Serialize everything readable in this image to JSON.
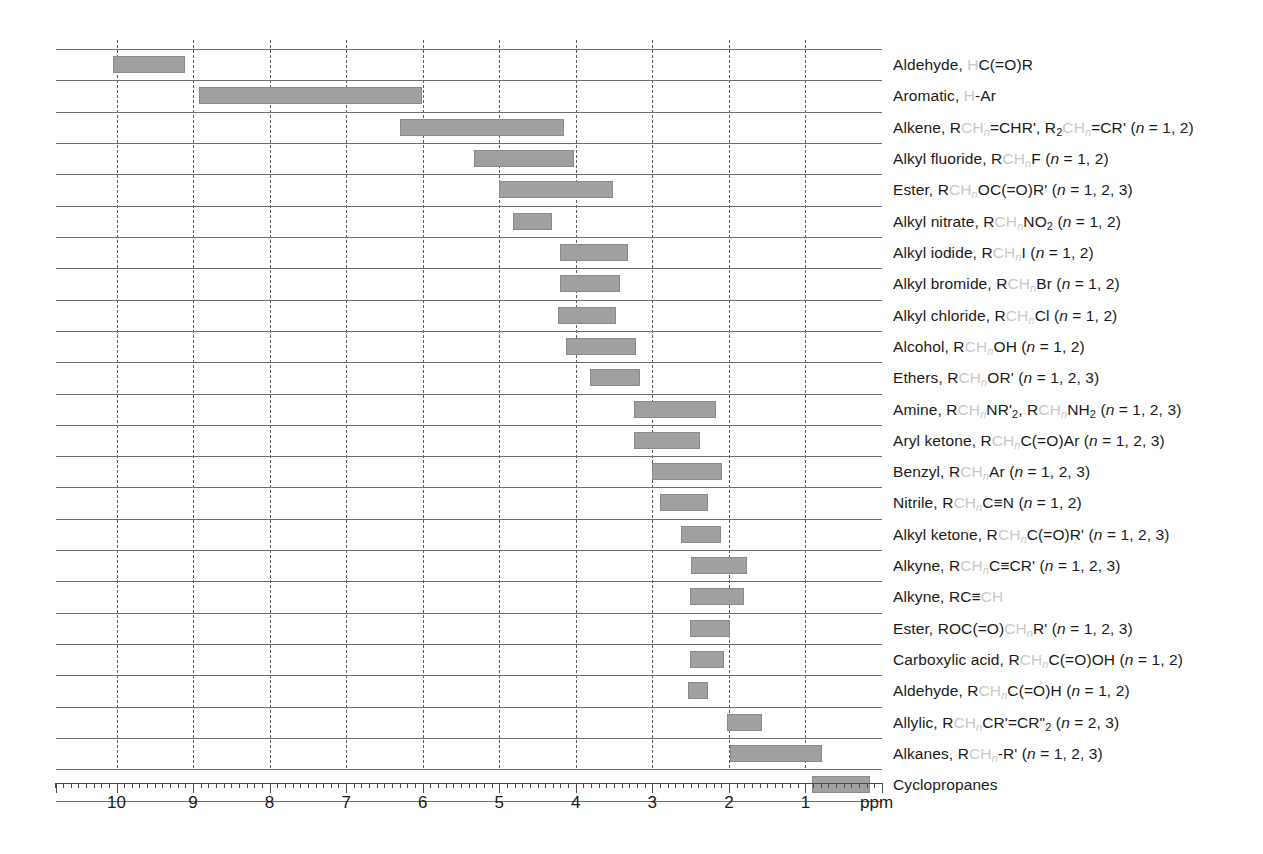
{
  "chart_data": {
    "type": "bar",
    "orientation": "horizontal-range",
    "title": "",
    "xlabel": "ppm",
    "ylabel": "",
    "xlim": [
      10.78,
      0
    ],
    "x_axis_reversed": true,
    "grid": true,
    "legend": null,
    "axis": {
      "unit_label": "ppm",
      "tick_labels": [
        "10",
        "9",
        "8",
        "7",
        "6",
        "5",
        "4",
        "3",
        "2",
        "1"
      ],
      "tick_values": [
        10,
        9,
        8,
        7,
        6,
        5,
        4,
        3,
        2,
        1
      ],
      "minor_tick_step": 0.1,
      "major_tick_step": 1
    },
    "gridline_values": [
      10,
      9,
      8,
      7,
      6,
      5,
      4,
      3,
      2,
      1
    ],
    "bar_color": "#a0a0a0",
    "highlight_color": "#c9c9c9",
    "categories": [
      "Aldehyde, HC(=O)R",
      "Aromatic, H-Ar",
      "Alkene, RCHn=CHR', RCHn=CR'2 (n = 1, 2)",
      "Alkyl fluoride, RCHnF (n = 1, 2)",
      "Ester, RCHnOC(=O)R' (n = 1, 2, 3)",
      "Alkyl nitrate, RCHnNO2 (n = 1, 2)",
      "Alkyl iodide, RCHnI (n = 1, 2)",
      "Alkyl bromide, RCHnBr (n = 1, 2)",
      "Alkyl chloride, RCHnCl (n = 1, 2)",
      "Alcohol, RCHnOH (n = 1, 2)",
      "Ethers, RCHnOR' (n = 1, 2, 3)",
      "Amine, RCHnNR'2, RCHnNH2 (n = 1, 2, 3)",
      "Aryl ketone, RCHnC(=O)Ar (n = 1, 2, 3)",
      "Benzyl, RCHnAr (n = 1, 2, 3)",
      "Nitrile, RCHnC≡N (n = 1, 2)",
      "Alkyl ketone, RCHnC(=O)R' (n = 1, 2, 3)",
      "Alkyne, RCHnC≡CR' (n = 1, 2, 3)",
      "Alkyne, RC≡CH",
      "Ester, ROC(=O)CHnR' (n = 1, 2, 3)",
      "Carboxylic acid, RCHnC(=O)OH (n = 1, 2)",
      "Aldehyde, RCHnC(=O)H (n = 1, 2)",
      "Allylic, RCHnCR'=CR\"2 (n = 2, 3)",
      "Alkanes, RCHn-R' (n = 1, 2, 3)",
      "Cyclopropanes"
    ],
    "ranges": [
      {
        "label": "Aldehyde",
        "from_ppm": 10.05,
        "to_ppm": 9.1
      },
      {
        "label": "Aromatic",
        "from_ppm": 8.92,
        "to_ppm": 6.01
      },
      {
        "label": "Alkene",
        "from_ppm": 6.3,
        "to_ppm": 4.16
      },
      {
        "label": "Alkyl fluoride",
        "from_ppm": 5.33,
        "to_ppm": 4.02
      },
      {
        "label": "Ester",
        "from_ppm": 5.0,
        "to_ppm": 3.51
      },
      {
        "label": "Alkyl nitrate",
        "from_ppm": 4.82,
        "to_ppm": 4.31
      },
      {
        "label": "Alkyl iodide",
        "from_ppm": 4.2,
        "to_ppm": 3.32
      },
      {
        "label": "Alkyl bromide",
        "from_ppm": 4.2,
        "to_ppm": 3.42
      },
      {
        "label": "Alkyl chloride",
        "from_ppm": 4.23,
        "to_ppm": 3.47
      },
      {
        "label": "Alcohol",
        "from_ppm": 4.13,
        "to_ppm": 3.21
      },
      {
        "label": "Ethers",
        "from_ppm": 3.81,
        "to_ppm": 3.16
      },
      {
        "label": "Amine",
        "from_ppm": 3.24,
        "to_ppm": 2.17
      },
      {
        "label": "Aryl ketone",
        "from_ppm": 3.24,
        "to_ppm": 2.38
      },
      {
        "label": "Benzyl",
        "from_ppm": 3.01,
        "to_ppm": 2.09
      },
      {
        "label": "Nitrile",
        "from_ppm": 2.9,
        "to_ppm": 2.27
      },
      {
        "label": "Alkyl ketone",
        "from_ppm": 2.62,
        "to_ppm": 2.1
      },
      {
        "label": "Alkyne",
        "from_ppm": 2.49,
        "to_ppm": 1.76
      },
      {
        "label": "Alkyne terminal",
        "from_ppm": 2.51,
        "to_ppm": 1.8
      },
      {
        "label": "Ester alpha",
        "from_ppm": 2.51,
        "to_ppm": 1.98
      },
      {
        "label": "Carboxylic acid",
        "from_ppm": 2.51,
        "to_ppm": 2.06
      },
      {
        "label": "Aldehyde alpha",
        "from_ppm": 2.53,
        "to_ppm": 2.27
      },
      {
        "label": "Allylic",
        "from_ppm": 2.02,
        "to_ppm": 1.57
      },
      {
        "label": "Alkanes",
        "from_ppm": 1.98,
        "to_ppm": 0.78
      },
      {
        "label": "Cyclopropanes",
        "from_ppm": 0.91,
        "to_ppm": 0.16
      }
    ]
  },
  "rows": [
    {
      "prefix": "Aldehyde, ",
      "hl1": "H",
      "mid": "C(=O)R",
      "hl2": "",
      "suffix": "",
      "nrange": ""
    },
    {
      "prefix": "Aromatic, ",
      "hl1": "H",
      "mid": "-Ar",
      "hl2": "",
      "suffix": "",
      "nrange": ""
    },
    {
      "prefix": "Alkene, R",
      "hl1": "CH",
      "hlsub": "n",
      "mid": "=CHR', R",
      "hl2": "CH",
      "hlsub2": "n",
      "suffix": "=CR'",
      "sub": "2",
      "nrange": " (n = 1, 2)"
    },
    {
      "prefix": "Alkyl fluoride, R",
      "hl1": "CH",
      "hlsub": "n",
      "mid": "F",
      "nrange": " (n = 1, 2)"
    },
    {
      "prefix": "Ester, R",
      "hl1": "CH",
      "hlsub": "n",
      "mid": "OC(=O)R'",
      "nrange": " (n = 1, 2, 3)"
    },
    {
      "prefix": "Alkyl nitrate, R",
      "hl1": "CH",
      "hlsub": "n",
      "mid": "NO",
      "sub": "2",
      "nrange": " (n = 1, 2)"
    },
    {
      "prefix": "Alkyl iodide, R",
      "hl1": "CH",
      "hlsub": "n",
      "mid": "I",
      "nrange": " (n = 1, 2)"
    },
    {
      "prefix": "Alkyl bromide, R",
      "hl1": "CH",
      "hlsub": "n",
      "mid": "Br",
      "nrange": " (n = 1, 2)"
    },
    {
      "prefix": "Alkyl chloride, R",
      "hl1": "CH",
      "hlsub": "n",
      "mid": "Cl",
      "nrange": " (n = 1, 2)"
    },
    {
      "prefix": "Alcohol, R",
      "hl1": "CH",
      "hlsub": "n",
      "mid": "OH",
      "nrange": " (n = 1, 2)"
    },
    {
      "prefix": "Ethers, R",
      "hl1": "CH",
      "hlsub": "n",
      "mid": "OR'",
      "nrange": " (n = 1, 2, 3)"
    },
    {
      "prefix": "Amine, R",
      "hl1": "CH",
      "hlsub": "n",
      "mid": "NR'",
      "sub": "2",
      "mid2": ", RCH",
      "hl2": "CH",
      "hlsub2": "n",
      "suffix": "NH",
      "sub2": "2",
      "nrange": " (n = 1, 2, 3)"
    },
    {
      "prefix": "Aryl ketone, R",
      "hl1": "CH",
      "hlsub": "n",
      "mid": "C(=O)Ar",
      "nrange": " (n = 1, 2, 3)"
    },
    {
      "prefix": "Benzyl, R",
      "hl1": "CH",
      "hlsub": "n",
      "mid": "Ar",
      "nrange": " (n = 1, 2, 3)"
    },
    {
      "prefix": "Nitrile, R",
      "hl1": "CH",
      "hlsub": "n",
      "mid": "C≡N",
      "nrange": " (n = 1, 2)"
    },
    {
      "prefix": "Alkyl ketone, R",
      "hl1": "CH",
      "hlsub": "n",
      "mid": "C(=O)R'",
      "nrange": " (n = 1, 2, 3)"
    },
    {
      "prefix": "Alkyne, R",
      "hl1": "CH",
      "hlsub": "n",
      "mid": "C≡CR'",
      "nrange": " (n = 1, 2, 3)"
    },
    {
      "prefix": "Alkyne, RC≡",
      "hl1": "CH",
      "hlsub": "",
      "mid": "",
      "nrange": ""
    },
    {
      "prefix": "Ester, ROC(=O)",
      "hl1": "CH",
      "hlsub": "n",
      "mid": "R'",
      "nrange": " (n = 1, 2, 3)"
    },
    {
      "prefix": "Carboxylic acid, R",
      "hl1": "CH",
      "hlsub": "n",
      "mid": "C(=O)OH",
      "nrange": " (n = 1, 2)"
    },
    {
      "prefix": "Aldehyde, R",
      "hl1": "CH",
      "hlsub": "n",
      "mid": "C(=O)H",
      "nrange": " (n = 1, 2)"
    },
    {
      "prefix": "Allylic, R",
      "hl1": "CH",
      "hlsub": "n",
      "mid": "CR'=CR\"",
      "sub": "2",
      "nrange": " (n = 2, 3)"
    },
    {
      "prefix": "Alkanes, R",
      "hl1": "CH",
      "hlsub": "n",
      "mid": "-R'",
      "nrange": " (n = 1, 2, 3)"
    },
    {
      "prefix": "Cyclopropanes",
      "hl1": "",
      "mid": "",
      "nrange": ""
    }
  ]
}
